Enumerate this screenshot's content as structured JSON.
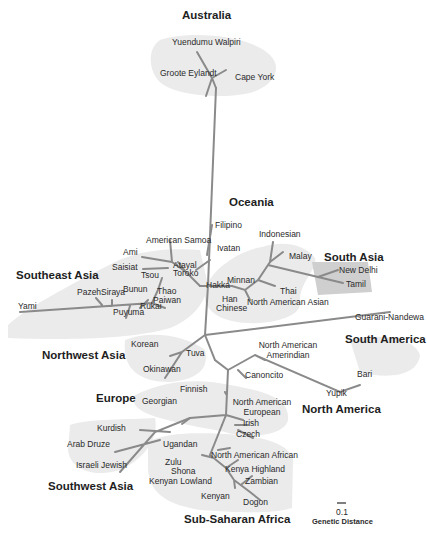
{
  "diagram": {
    "type": "unrooted phylogenetic tree",
    "scale_bar": {
      "value": "0.1",
      "label": "Genetic Distance"
    },
    "regions": [
      {
        "name": "Australia",
        "populations": [
          "Yuendumu Walpiri",
          "Groote Eylandt",
          "Cape York"
        ]
      },
      {
        "name": "Oceania",
        "populations": [
          "Filipino",
          "Ivatan"
        ]
      },
      {
        "name": "Southeast Asia",
        "populations": [
          "American Samoa",
          "Ami",
          "Saisiat",
          "Atayal",
          "Toroko",
          "Tsou",
          "Bunun",
          "Thao",
          "Paiwan",
          "Pazeh",
          "Siraya",
          "Yami",
          "Puyuma",
          "Rukai"
        ]
      },
      {
        "name": "East Asia",
        "populations": [
          "Indonesian",
          "Malay",
          "Hakka",
          "Minnan",
          "Thai",
          "Han Chinese",
          "North American Asian"
        ]
      },
      {
        "name": "South Asia",
        "populations": [
          "New Delhi",
          "Tamil"
        ]
      },
      {
        "name": "South America",
        "populations": [
          "Guarani-Nandewa"
        ]
      },
      {
        "name": "Northwest Asia",
        "populations": [
          "Korean",
          "Okinawan",
          "Tuva"
        ]
      },
      {
        "name": "North America",
        "populations": [
          "North American Amerindian",
          "Canoncito",
          "Bari",
          "Yupik"
        ]
      },
      {
        "name": "Europe",
        "populations": [
          "Finnish",
          "Georgian",
          "North American European",
          "Irish",
          "Czech"
        ]
      },
      {
        "name": "Southwest Asia",
        "populations": [
          "Kurdish",
          "Arab Druze",
          "Israeli Jewish"
        ]
      },
      {
        "name": "Sub-Saharan Africa",
        "populations": [
          "Ugandan",
          "North American African",
          "Zulu",
          "Shona",
          "Kenyan Lowland",
          "Kenya Highland",
          "Zambian",
          "Kenyan",
          "Dogon"
        ]
      }
    ]
  },
  "regions": {
    "australia": "Australia",
    "oceania": "Oceania",
    "southeast_asia": "Southeast Asia",
    "south_asia": "South Asia",
    "northwest_asia": "Northwest Asia",
    "south_america": "South America",
    "europe": "Europe",
    "north_america": "North America",
    "southwest_asia": "Southwest Asia",
    "sub_saharan_africa": "Sub-Saharan Africa"
  },
  "labels": {
    "yuendumu_walpiri": "Yuendumu Walpiri",
    "groote_eylandt": "Groote Eylandt",
    "cape_york": "Cape York",
    "filipino": "Filipino",
    "ivatan": "Ivatan",
    "american_samoa": "American Samoa",
    "ami": "Ami",
    "saisiat": "Saisiat",
    "atayal": "Atayal",
    "toroko": "Toroko",
    "tsou": "Tsou",
    "bunun": "Bunun",
    "thao": "Thao",
    "paiwan": "Paiwan",
    "pazeh": "Pazeh",
    "siraya": "Siraya",
    "yami": "Yami",
    "puyuma": "Puyuma",
    "rukai": "Rukai",
    "indonesian": "Indonesian",
    "malay": "Malay",
    "hakka": "Hakka",
    "minnan": "Minnan",
    "thai": "Thai",
    "han": "Han",
    "chinese": "Chinese",
    "north_american_asian": "North American Asian",
    "new_delhi": "New Delhi",
    "tamil": "Tamil",
    "guarani_nandewa": "Guarani-Nandewa",
    "korean": "Korean",
    "okinawan": "Okinawan",
    "tuva": "Tuva",
    "na_amerindian_1": "North American",
    "na_amerindian_2": "Amerindian",
    "canoncito": "Canoncito",
    "bari": "Bari",
    "yupik": "Yupik",
    "finnish": "Finnish",
    "georgian": "Georgian",
    "na_european_1": "North American",
    "na_european_2": "European",
    "irish": "Irish",
    "czech": "Czech",
    "kurdish": "Kurdish",
    "arab_druze": "Arab Druze",
    "israeli_jewish": "Israeli Jewish",
    "ugandan": "Ugandan",
    "north_american_african": "North American African",
    "zulu": "Zulu",
    "shona": "Shona",
    "kenyan_lowland": "Kenyan Lowland",
    "kenya_highland": "Kenya Highland",
    "zambian": "Zambian",
    "kenyan": "Kenyan",
    "dogon": "Dogon"
  },
  "scale": {
    "value": "0.1",
    "label": "Genetic Distance"
  }
}
